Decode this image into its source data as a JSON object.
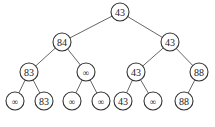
{
  "diagram": {
    "type": "binary-tree",
    "nodes": [
      {
        "id": "n0",
        "label": "43",
        "x": 120,
        "y": 12
      },
      {
        "id": "n1",
        "label": "84",
        "x": 62,
        "y": 42
      },
      {
        "id": "n2",
        "label": "43",
        "x": 170,
        "y": 42
      },
      {
        "id": "n3",
        "label": "83",
        "x": 29,
        "y": 72
      },
      {
        "id": "n4",
        "label": "∞",
        "x": 86,
        "y": 72
      },
      {
        "id": "n5",
        "label": "43",
        "x": 136,
        "y": 72
      },
      {
        "id": "n6",
        "label": "88",
        "x": 199,
        "y": 72
      },
      {
        "id": "n7",
        "label": "∞",
        "x": 15,
        "y": 101
      },
      {
        "id": "n8",
        "label": "83",
        "x": 44,
        "y": 101
      },
      {
        "id": "n9",
        "label": "∞",
        "x": 72,
        "y": 101
      },
      {
        "id": "n10",
        "label": "∞",
        "x": 101,
        "y": 101
      },
      {
        "id": "n11",
        "label": "43",
        "x": 123,
        "y": 101
      },
      {
        "id": "n12",
        "label": "∞",
        "x": 153,
        "y": 101
      },
      {
        "id": "n13",
        "label": "88",
        "x": 184,
        "y": 101
      }
    ],
    "edges": [
      [
        "n0",
        "n1"
      ],
      [
        "n0",
        "n2"
      ],
      [
        "n1",
        "n3"
      ],
      [
        "n1",
        "n4"
      ],
      [
        "n2",
        "n5"
      ],
      [
        "n2",
        "n6"
      ],
      [
        "n3",
        "n7"
      ],
      [
        "n3",
        "n8"
      ],
      [
        "n4",
        "n9"
      ],
      [
        "n4",
        "n10"
      ],
      [
        "n5",
        "n11"
      ],
      [
        "n5",
        "n12"
      ],
      [
        "n6",
        "n13"
      ]
    ],
    "node_radius": 9,
    "colors": {
      "stroke": "#333333",
      "edge": "#555555",
      "text": "#222222",
      "background": "#ffffff"
    }
  }
}
